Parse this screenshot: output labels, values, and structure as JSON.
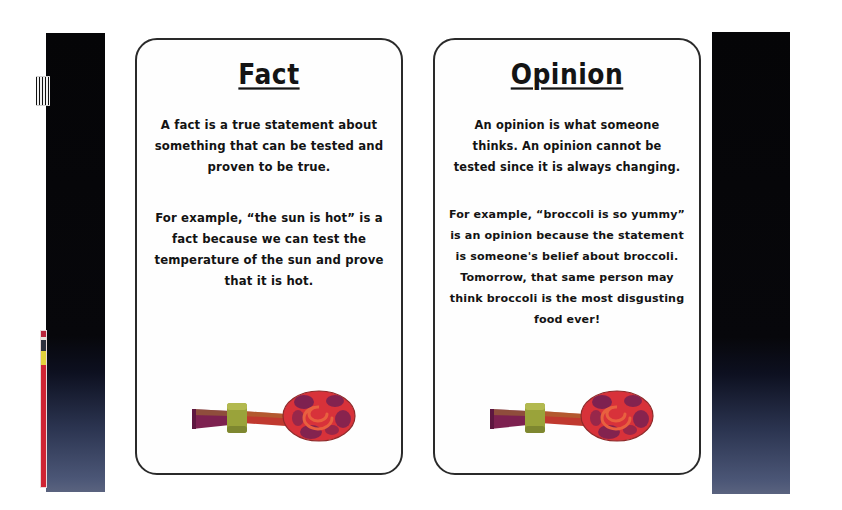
{
  "page": {
    "background_color": "#ffffff",
    "width": 842,
    "height": 510
  },
  "artifacts": {
    "left_band": {
      "name": "scan-edge-band-left",
      "color_top": "#050507",
      "color_bottom": "#5a637f"
    },
    "right_band": {
      "name": "scan-edge-band-right",
      "color_top": "#050507",
      "color_bottom": "#5a637f"
    },
    "calibration_strip": {
      "name": "color-calibration-strip",
      "colors": [
        "#cf2433",
        "#2d2f3d",
        "#e3d23c"
      ]
    },
    "barcode_mark": {
      "name": "barcode-mark"
    }
  },
  "cards": [
    {
      "id": "fact",
      "title": "Fact",
      "paragraphs": [
        "A fact is a true statement about something that can be tested and proven to be true.",
        "For example, “the sun is hot” is a fact because we can test the temperature of the sun and prove that it is hot."
      ],
      "illustration": {
        "name": "party-blower-illustration",
        "colors": {
          "coil_red": "#d8323a",
          "coil_purple": "#6e1f55",
          "mouthpiece_green": "#9aa33a",
          "tube_red": "#c0392f"
        }
      }
    },
    {
      "id": "opinion",
      "title": "Opinion",
      "paragraphs": [
        "An opinion is what someone thinks.  An opinion cannot be tested since it is always changing.",
        "For example, “broccoli is so yummy” is an opinion because the statement is someone's belief about broccoli.  Tomorrow, that same person may think broccoli is the most disgusting food ever!"
      ],
      "illustration": {
        "name": "party-blower-illustration",
        "colors": {
          "coil_red": "#d8323a",
          "coil_purple": "#6e1f55",
          "mouthpiece_green": "#9aa33a",
          "tube_red": "#c0392f"
        }
      }
    }
  ]
}
